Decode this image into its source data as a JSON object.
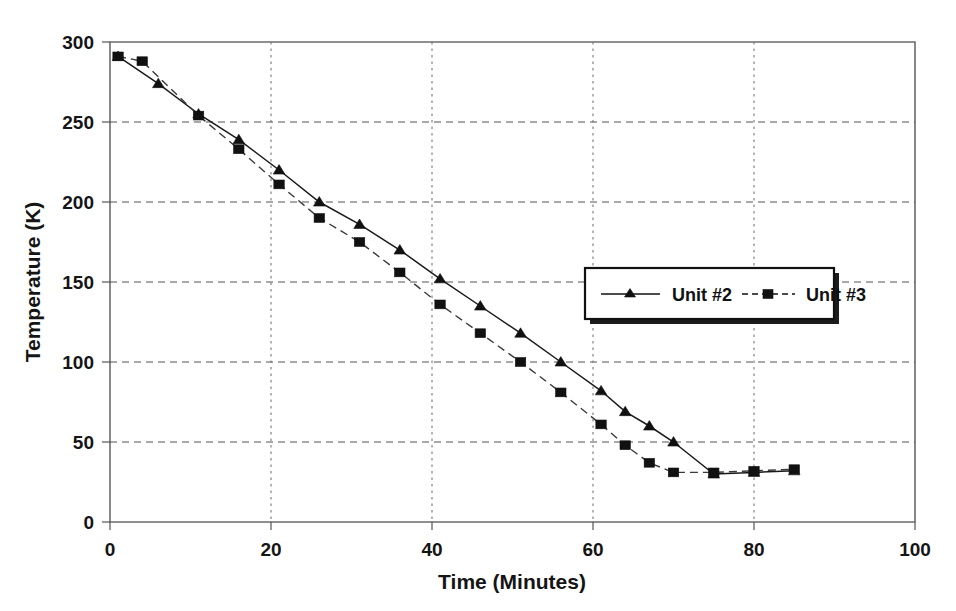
{
  "chart_data": {
    "type": "line",
    "title": "",
    "xlabel": "Time (Minutes)",
    "ylabel": "Temperature (K)",
    "xlim": [
      0,
      100
    ],
    "ylim": [
      0,
      300
    ],
    "xticks": [
      0,
      20,
      40,
      60,
      80,
      100
    ],
    "yticks": [
      0,
      50,
      100,
      150,
      200,
      250,
      300
    ],
    "xtick_labels": [
      "0",
      "20",
      "40",
      "60",
      "80",
      "100"
    ],
    "ytick_labels": [
      "0",
      "50",
      "100",
      "150",
      "200",
      "250",
      "300"
    ],
    "grid": true,
    "grid_horizontal": true,
    "grid_vertical": true,
    "legend_position": "center-right",
    "series": [
      {
        "name": "Unit #2",
        "marker": "triangle",
        "linestyle": "solid",
        "color": "#111111",
        "x": [
          1,
          6,
          11,
          16,
          21,
          26,
          31,
          36,
          41,
          46,
          51,
          56,
          61,
          64,
          67,
          70,
          75,
          80,
          85
        ],
        "y": [
          291,
          274,
          255,
          239,
          220,
          200,
          186,
          170,
          152,
          135,
          118,
          100,
          82,
          69,
          60,
          50,
          30,
          31,
          32
        ]
      },
      {
        "name": "Unit #3",
        "marker": "square",
        "linestyle": "dashed",
        "color": "#111111",
        "x": [
          1,
          4,
          11,
          16,
          21,
          26,
          31,
          36,
          41,
          46,
          51,
          56,
          61,
          64,
          67,
          70,
          75,
          80,
          85
        ],
        "y": [
          291,
          288,
          254,
          233,
          211,
          190,
          175,
          156,
          136,
          118,
          100,
          81,
          61,
          48,
          37,
          31,
          31,
          32,
          33
        ]
      }
    ]
  },
  "legend": {
    "entries": [
      {
        "label": "Unit #2",
        "marker": "triangle-marker",
        "linestyle": "solid"
      },
      {
        "label": "Unit #3",
        "marker": "square-marker",
        "linestyle": "dashed"
      }
    ]
  },
  "axes": {
    "x_title": "Time (Minutes)",
    "y_title": "Temperature (K)"
  },
  "colors": {
    "background": "#ffffff",
    "series": "#111111",
    "frame": "#6b6b6b",
    "grid": "#555555",
    "text": "#151515"
  }
}
